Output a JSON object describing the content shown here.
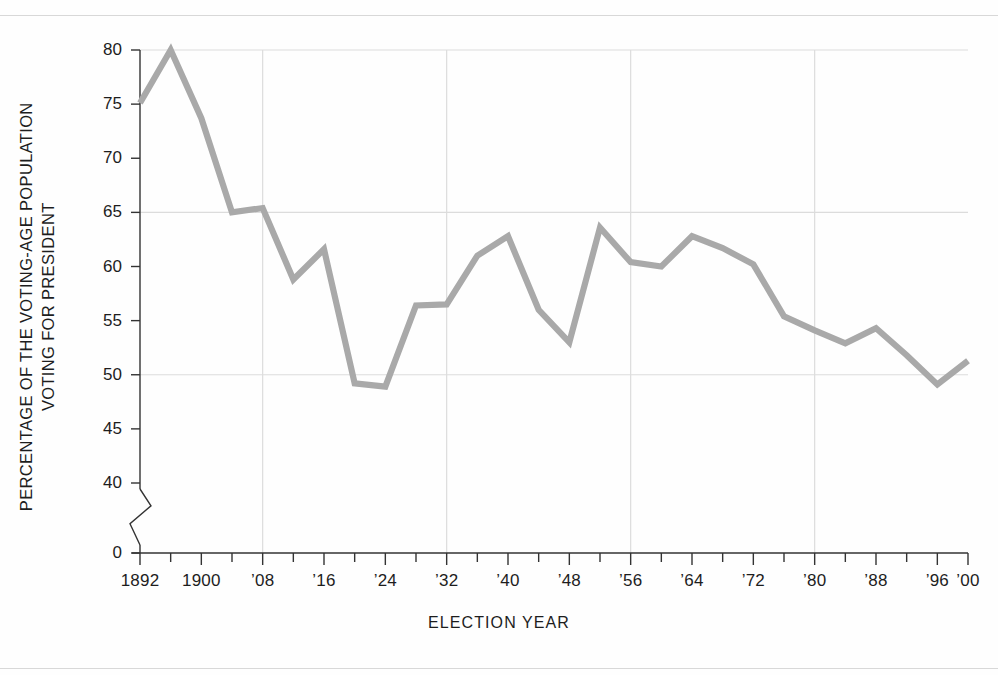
{
  "chart_data": {
    "type": "line",
    "title": "",
    "xlabel": "ELECTION  YEAR",
    "ylabel_lines": [
      "PERCENTAGE OF THE VOTING-AGE POPULATION",
      "VOTING FOR PRESIDENT"
    ],
    "ylabel": "PERCENTAGE OF THE VOTING-AGE POPULATION VOTING FOR PRESIDENT",
    "x": [
      1892,
      1896,
      1900,
      1904,
      1908,
      1912,
      1916,
      1920,
      1924,
      1928,
      1932,
      1936,
      1940,
      1944,
      1948,
      1952,
      1956,
      1960,
      1964,
      1968,
      1972,
      1976,
      1980,
      1984,
      1988,
      1992,
      1996,
      2000
    ],
    "values": [
      75.1,
      80.0,
      73.7,
      65.0,
      65.4,
      58.8,
      61.6,
      49.2,
      48.9,
      56.4,
      56.5,
      61.0,
      62.8,
      56.0,
      53.0,
      63.6,
      60.4,
      60.0,
      62.8,
      61.7,
      60.2,
      55.4,
      54.1,
      52.9,
      54.3,
      51.8,
      55.6,
      49.1
    ],
    "last_point_value": 51.3,
    "series": [
      {
        "name": "Voter turnout",
        "color": "#a9a9a9",
        "points": [
          {
            "year": 1892,
            "value": 75.1
          },
          {
            "year": 1896,
            "value": 80.0
          },
          {
            "year": 1900,
            "value": 73.7
          },
          {
            "year": 1904,
            "value": 65.0
          },
          {
            "year": 1908,
            "value": 65.4
          },
          {
            "year": 1912,
            "value": 58.8
          },
          {
            "year": 1916,
            "value": 61.6
          },
          {
            "year": 1920,
            "value": 49.2
          },
          {
            "year": 1924,
            "value": 48.9
          },
          {
            "year": 1928,
            "value": 56.4
          },
          {
            "year": 1932,
            "value": 56.5
          },
          {
            "year": 1936,
            "value": 61.0
          },
          {
            "year": 1940,
            "value": 62.8
          },
          {
            "year": 1944,
            "value": 56.0
          },
          {
            "year": 1948,
            "value": 53.0
          },
          {
            "year": 1952,
            "value": 63.6
          },
          {
            "year": 1956,
            "value": 60.4
          },
          {
            "year": 1960,
            "value": 60.0
          },
          {
            "year": 1964,
            "value": 62.8
          },
          {
            "year": 1968,
            "value": 61.7
          },
          {
            "year": 1972,
            "value": 60.2
          },
          {
            "year": 1976,
            "value": 55.4
          },
          {
            "year": 1980,
            "value": 54.1
          },
          {
            "year": 1984,
            "value": 52.9
          },
          {
            "year": 1988,
            "value": 54.3
          },
          {
            "year": 1992,
            "value": 51.8
          },
          {
            "year": 1996,
            "value": 49.1
          },
          {
            "year": 2000,
            "value": 51.3
          }
        ]
      }
    ],
    "yticks": [
      {
        "label": "80",
        "value": 80
      },
      {
        "label": "75",
        "value": 75
      },
      {
        "label": "70",
        "value": 70
      },
      {
        "label": "65",
        "value": 65
      },
      {
        "label": "60",
        "value": 60
      },
      {
        "label": "55",
        "value": 55
      },
      {
        "label": "50",
        "value": 50
      },
      {
        "label": "45",
        "value": 45
      },
      {
        "label": "40",
        "value": 40
      },
      {
        "label": "0",
        "value": 0
      }
    ],
    "ylim": [
      40,
      80
    ],
    "y_axis_break": true,
    "y_axis_break_note": "zigzag break between 40 and 0",
    "xticks_labeled": [
      {
        "label": "1892",
        "year": 1892
      },
      {
        "label": "1900",
        "year": 1900
      },
      {
        "label": "’08",
        "year": 1908
      },
      {
        "label": "’16",
        "year": 1916
      },
      {
        "label": "’24",
        "year": 1924
      },
      {
        "label": "’32",
        "year": 1932
      },
      {
        "label": "’40",
        "year": 1940
      },
      {
        "label": "’48",
        "year": 1948
      },
      {
        "label": "’56",
        "year": 1956
      },
      {
        "label": "’64",
        "year": 1964
      },
      {
        "label": "’72",
        "year": 1972
      },
      {
        "label": "’80",
        "year": 1980
      },
      {
        "label": "’88",
        "year": 1988
      },
      {
        "label": "’96",
        "year": 1996
      },
      {
        "label": "’00",
        "year": 2000
      }
    ],
    "xlim": [
      1892,
      2000
    ],
    "grid": {
      "horizontal_values": [
        80,
        65,
        50
      ],
      "vertical_years": [
        1908,
        1932,
        1956,
        1980
      ],
      "color": "#dcdcdc"
    },
    "legend": null,
    "colors": {
      "line": "#a9a9a9",
      "axis": "#333333",
      "grid": "#dcdcdc",
      "text": "#1d1d1d",
      "background": "#fefefe"
    }
  }
}
